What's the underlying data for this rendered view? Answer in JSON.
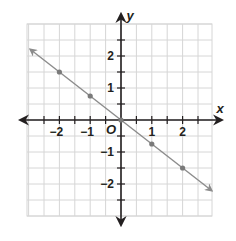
{
  "chart_data": {
    "type": "line",
    "title": "",
    "xlabel": "x",
    "ylabel": "y",
    "origin_label": "O",
    "xlim": [
      -3,
      3
    ],
    "ylim": [
      -3,
      3
    ],
    "grid": true,
    "grid_step": 0.5,
    "x_ticks": [
      -2,
      -1,
      1,
      2
    ],
    "x_tick_labels": [
      "−2",
      "−1",
      "1",
      "2"
    ],
    "y_ticks": [
      2,
      1,
      -1,
      -2
    ],
    "y_tick_labels": [
      "2",
      "1",
      "−1",
      "−2"
    ],
    "series": [
      {
        "name": "line",
        "equation": "y = -0.75x",
        "x": [
          -2,
          -1,
          0,
          1,
          2
        ],
        "y": [
          1.5,
          0.75,
          0,
          -0.75,
          -1.5
        ],
        "color": "#8c8c8c",
        "arrows": "both"
      }
    ],
    "colors": {
      "axis": "#231f20",
      "grid": "#d6d6d6",
      "line": "#8c8c8c",
      "points": "#7a7a7a"
    }
  }
}
